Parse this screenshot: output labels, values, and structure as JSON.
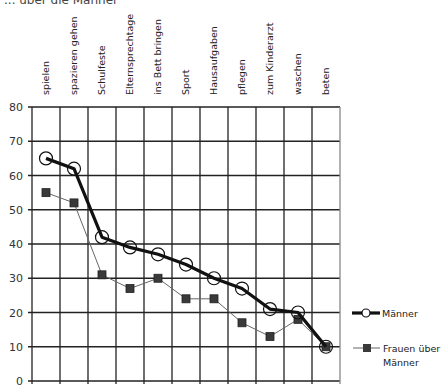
{
  "title_fragment": "... über die Männer",
  "chart_data": {
    "type": "line",
    "title": "... über die Männer",
    "xlabel": "",
    "ylabel": "",
    "ylim": [
      0,
      80
    ],
    "yticks": [
      0,
      10,
      20,
      30,
      40,
      50,
      60,
      70,
      80
    ],
    "grid": true,
    "legend_position": "right",
    "categories": [
      "spielen",
      "spazieren gehen",
      "Schulfeste",
      "Elternsprechtage",
      "ins Bett bringen",
      "Sport",
      "Hausaufgaben",
      "pflegen",
      "zum Kinderarzt",
      "waschen",
      "beten"
    ],
    "series": [
      {
        "name": "Männer",
        "marker": "open-circle",
        "line": "thick-black",
        "color": "#111111",
        "values": [
          65,
          62,
          42,
          39,
          37,
          34,
          30,
          27,
          21,
          20,
          10
        ]
      },
      {
        "name": "Frauen über Männer",
        "marker": "filled-square",
        "line": "thin-gray",
        "color": "#555555",
        "values": [
          55,
          52,
          31,
          27,
          30,
          24,
          24,
          17,
          13,
          18,
          10
        ]
      }
    ]
  },
  "legend": [
    {
      "label_lines": [
        "Männer"
      ]
    },
    {
      "label_lines": [
        "Frauen über",
        "Männer"
      ]
    }
  ]
}
